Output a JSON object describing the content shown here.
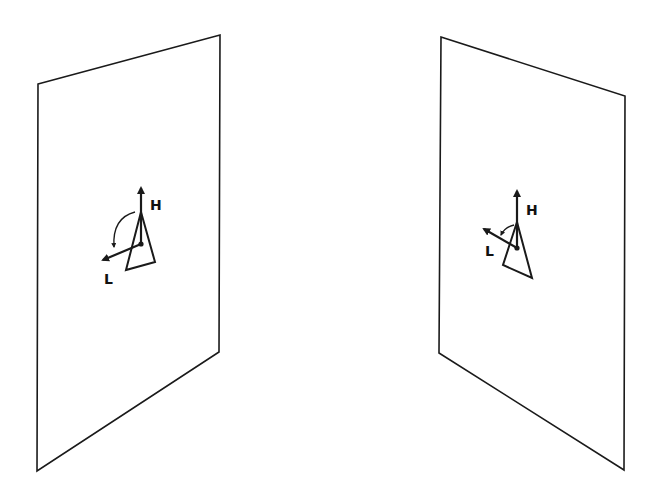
{
  "diagram": {
    "colors": {
      "stroke": "#1a1a1a",
      "background": "#ffffff"
    },
    "panels": [
      {
        "id": "left",
        "corners": [
          [
            38,
            84
          ],
          [
            220,
            35
          ],
          [
            219,
            352
          ],
          [
            37,
            471
          ]
        ],
        "labels": {
          "h": "H",
          "l": "L"
        }
      },
      {
        "id": "right",
        "corners": [
          [
            441,
            37
          ],
          [
            625,
            96
          ],
          [
            624,
            470
          ],
          [
            439,
            353
          ]
        ],
        "labels": {
          "h": "H",
          "l": "L"
        }
      }
    ]
  }
}
